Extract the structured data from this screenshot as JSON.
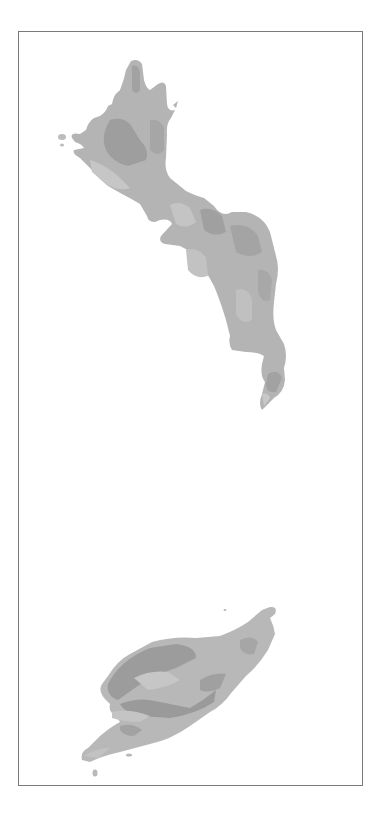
{
  "map": {
    "frame": {
      "x": 18,
      "y": 31,
      "width": 345,
      "height": 755,
      "stroke": "#7a7a7a"
    },
    "palette": {
      "light": "#c9c9c9",
      "mid_light": "#bcbcbc",
      "mid": "#b0b0b0",
      "mid_dark": "#a4a4a4",
      "dark": "#989898"
    },
    "features": [
      {
        "name": "northern-island",
        "type": "landmass"
      },
      {
        "name": "southern-island",
        "type": "landmass"
      }
    ]
  }
}
